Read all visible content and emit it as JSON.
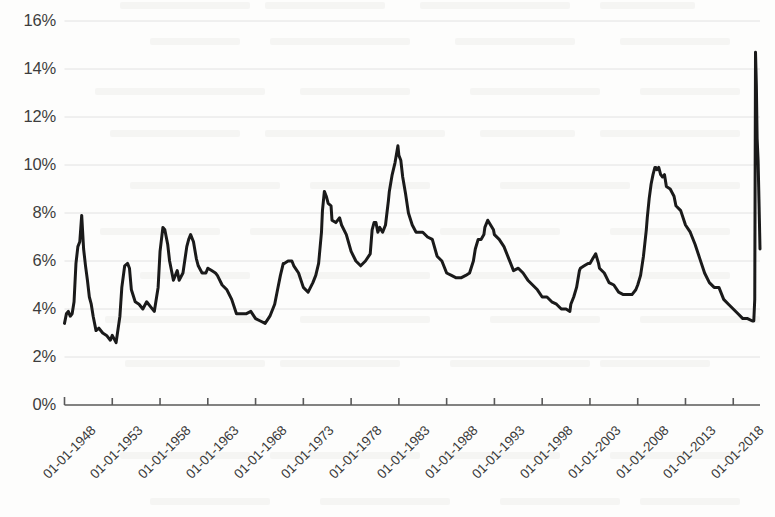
{
  "chart_data": {
    "type": "line",
    "title": "",
    "subtitle": "",
    "xlabel": "",
    "ylabel": "",
    "grid": true,
    "legend": false,
    "legend_position": "none",
    "line_color": "#1a1a1a",
    "grid_color": "#e2e2e2",
    "axis_color": "#595959",
    "background_color": "#fdfdfc",
    "ylim": [
      0,
      16
    ],
    "ytick_labels": [
      "0%",
      "2%",
      "4%",
      "6%",
      "8%",
      "10%",
      "12%",
      "14%",
      "16%"
    ],
    "ytick_values": [
      0,
      2,
      4,
      6,
      8,
      10,
      12,
      14,
      16
    ],
    "xtick_labels": [
      "01-01-1948",
      "01-01-1953",
      "01-01-1958",
      "01-01-1963",
      "01-01-1968",
      "01-01-1973",
      "01-01-1978",
      "01-01-1983",
      "01-01-1988",
      "01-01-1993",
      "01-01-1998",
      "01-01-2003",
      "01-01-2008",
      "01-01-2013",
      "01-01-2018"
    ],
    "xtick_values": [
      1948,
      1953,
      1958,
      1963,
      1968,
      1973,
      1978,
      1983,
      1988,
      1993,
      1998,
      2003,
      2008,
      2013,
      2018
    ],
    "xlim": [
      1948,
      2020.8
    ],
    "series": [
      {
        "name": "Unemployment rate",
        "x": [
          1948.0,
          1948.2,
          1948.4,
          1948.6,
          1948.8,
          1949.0,
          1949.2,
          1949.4,
          1949.6,
          1949.8,
          1950.0,
          1950.2,
          1950.4,
          1950.6,
          1950.8,
          1951.0,
          1951.3,
          1951.6,
          1952.0,
          1952.4,
          1952.8,
          1953.0,
          1953.4,
          1953.8,
          1954.0,
          1954.3,
          1954.6,
          1954.8,
          1955.0,
          1955.4,
          1955.8,
          1956.2,
          1956.6,
          1957.0,
          1957.4,
          1957.8,
          1958.0,
          1958.3,
          1958.5,
          1958.8,
          1959.0,
          1959.4,
          1959.8,
          1960.0,
          1960.4,
          1960.8,
          1961.0,
          1961.2,
          1961.5,
          1961.8,
          1962.0,
          1962.4,
          1962.8,
          1963.0,
          1963.4,
          1963.8,
          1964.0,
          1964.5,
          1965.0,
          1965.5,
          1966.0,
          1966.5,
          1967.0,
          1967.5,
          1968.0,
          1968.5,
          1969.0,
          1969.5,
          1970.0,
          1970.3,
          1970.6,
          1970.9,
          1971.0,
          1971.4,
          1971.8,
          1972.0,
          1972.5,
          1973.0,
          1973.5,
          1974.0,
          1974.3,
          1974.6,
          1974.9,
          1975.0,
          1975.2,
          1975.4,
          1975.6,
          1975.9,
          1976.0,
          1976.4,
          1976.8,
          1977.0,
          1977.5,
          1978.0,
          1978.5,
          1979.0,
          1979.5,
          1980.0,
          1980.2,
          1980.4,
          1980.6,
          1980.8,
          1981.0,
          1981.3,
          1981.6,
          1981.9,
          1982.0,
          1982.3,
          1982.6,
          1982.9,
          1983.0,
          1983.2,
          1983.4,
          1983.7,
          1984.0,
          1984.4,
          1984.8,
          1985.0,
          1985.5,
          1986.0,
          1986.5,
          1987.0,
          1987.5,
          1988.0,
          1988.5,
          1989.0,
          1989.5,
          1990.0,
          1990.4,
          1990.8,
          1991.0,
          1991.3,
          1991.6,
          1991.9,
          1992.0,
          1992.3,
          1992.6,
          1992.9,
          1993.0,
          1993.5,
          1994.0,
          1994.5,
          1995.0,
          1995.5,
          1996.0,
          1996.5,
          1997.0,
          1997.5,
          1998.0,
          1998.5,
          1999.0,
          1999.5,
          2000.0,
          2000.5,
          2000.9,
          2001.0,
          2001.3,
          2001.6,
          2001.9,
          2002.0,
          2002.4,
          2002.8,
          2003.0,
          2003.3,
          2003.6,
          2003.9,
          2004.0,
          2004.5,
          2005.0,
          2005.5,
          2006.0,
          2006.5,
          2007.0,
          2007.4,
          2007.8,
          2008.0,
          2008.3,
          2008.6,
          2008.9,
          2009.0,
          2009.2,
          2009.4,
          2009.6,
          2009.8,
          2009.9,
          2010.0,
          2010.2,
          2010.4,
          2010.6,
          2010.8,
          2011.0,
          2011.4,
          2011.8,
          2012.0,
          2012.5,
          2013.0,
          2013.5,
          2014.0,
          2014.5,
          2015.0,
          2015.5,
          2016.0,
          2016.5,
          2017.0,
          2017.5,
          2018.0,
          2018.5,
          2019.0,
          2019.5,
          2020.0,
          2020.15,
          2020.25,
          2020.33,
          2020.42,
          2020.5,
          2020.6,
          2020.7,
          2020.8
        ],
        "values": [
          3.4,
          3.8,
          3.9,
          3.7,
          3.8,
          4.3,
          5.9,
          6.6,
          6.8,
          7.9,
          6.5,
          5.8,
          5.2,
          4.5,
          4.2,
          3.7,
          3.1,
          3.2,
          3.0,
          2.9,
          2.7,
          2.9,
          2.6,
          3.7,
          4.9,
          5.8,
          5.9,
          5.7,
          4.8,
          4.3,
          4.2,
          4.0,
          4.3,
          4.1,
          3.9,
          4.9,
          6.4,
          7.4,
          7.3,
          6.7,
          6.0,
          5.2,
          5.6,
          5.2,
          5.5,
          6.6,
          6.9,
          7.1,
          6.8,
          6.1,
          5.8,
          5.5,
          5.5,
          5.7,
          5.6,
          5.5,
          5.4,
          5.0,
          4.8,
          4.4,
          3.8,
          3.8,
          3.8,
          3.9,
          3.6,
          3.5,
          3.4,
          3.7,
          4.2,
          4.8,
          5.4,
          5.9,
          5.9,
          6.0,
          6.0,
          5.8,
          5.5,
          4.9,
          4.7,
          5.1,
          5.4,
          5.9,
          7.2,
          8.1,
          8.9,
          8.7,
          8.4,
          8.3,
          7.7,
          7.6,
          7.8,
          7.5,
          7.1,
          6.4,
          6.0,
          5.8,
          6.0,
          6.3,
          7.3,
          7.6,
          7.6,
          7.2,
          7.4,
          7.2,
          7.5,
          8.5,
          8.9,
          9.6,
          10.1,
          10.8,
          10.4,
          10.2,
          9.5,
          8.8,
          8.0,
          7.5,
          7.2,
          7.2,
          7.2,
          7.0,
          6.9,
          6.2,
          6.0,
          5.5,
          5.4,
          5.3,
          5.3,
          5.4,
          5.5,
          6.0,
          6.5,
          6.9,
          6.9,
          7.1,
          7.4,
          7.7,
          7.5,
          7.3,
          7.1,
          6.9,
          6.6,
          6.1,
          5.6,
          5.7,
          5.5,
          5.2,
          5.0,
          4.8,
          4.5,
          4.5,
          4.3,
          4.2,
          4.0,
          4.0,
          3.9,
          4.2,
          4.5,
          4.9,
          5.6,
          5.7,
          5.8,
          5.9,
          5.9,
          6.1,
          6.3,
          5.9,
          5.7,
          5.5,
          5.1,
          5.0,
          4.7,
          4.6,
          4.6,
          4.6,
          4.8,
          5.0,
          5.4,
          6.2,
          7.3,
          7.8,
          8.6,
          9.2,
          9.6,
          9.9,
          9.9,
          9.8,
          9.9,
          9.6,
          9.5,
          9.6,
          9.1,
          9.0,
          8.7,
          8.3,
          8.1,
          7.5,
          7.2,
          6.7,
          6.1,
          5.5,
          5.1,
          4.9,
          4.9,
          4.4,
          4.2,
          4.0,
          3.8,
          3.6,
          3.6,
          3.5,
          3.5,
          4.4,
          14.7,
          13.3,
          11.1,
          10.2,
          8.4,
          6.5
        ]
      }
    ],
    "annotations": []
  },
  "axis": {
    "y_title": "",
    "x_title": ""
  }
}
